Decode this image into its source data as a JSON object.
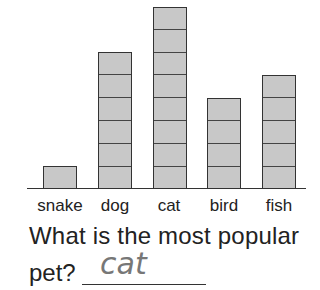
{
  "chart_data": {
    "type": "bar",
    "title": "",
    "xlabel": "",
    "ylabel": "",
    "categories": [
      "snake",
      "dog",
      "cat",
      "bird",
      "fish"
    ],
    "values": [
      1,
      6,
      8,
      4,
      5
    ],
    "ylim": [
      0,
      8
    ],
    "grid": false,
    "legend": null,
    "style": "pictograph bars with one box per unit"
  },
  "question": {
    "line1": "What is the most popular",
    "line2": "pet?",
    "answer": "cat"
  },
  "colors": {
    "bar_fill": "#c8c8c8",
    "bar_border": "#333333",
    "answer_pencil": "#777777"
  }
}
